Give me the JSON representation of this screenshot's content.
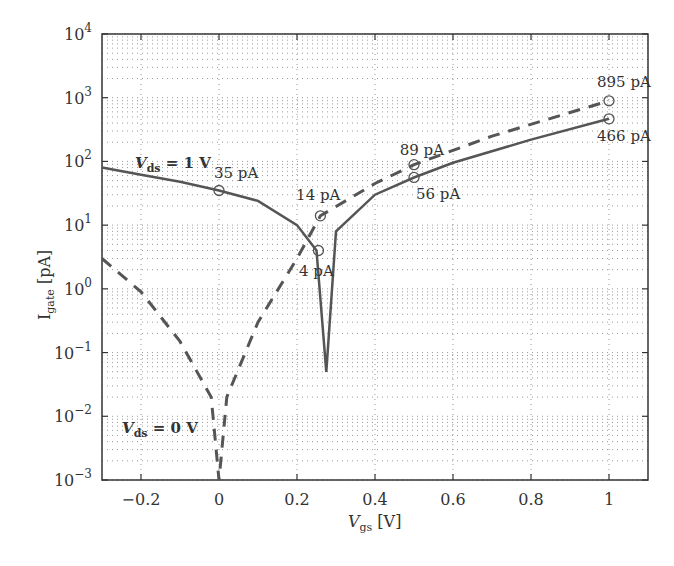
{
  "chart_data": {
    "type": "line",
    "title": "",
    "xlabel": "V_gs [V]",
    "ylabel": "I_gate [pA]",
    "xlim": [
      -0.3,
      1.1
    ],
    "ylim": [
      0.001,
      10000
    ],
    "yscale": "log",
    "grid": true,
    "x_ticks": [
      "-0.2",
      "0",
      "0.2",
      "0.4",
      "0.6",
      "0.8",
      "1"
    ],
    "y_ticks": [
      "10^-3",
      "10^-2",
      "10^-1",
      "10^0",
      "10^1",
      "10^2",
      "10^3",
      "10^4"
    ],
    "series": [
      {
        "name": "V_ds = 1 V",
        "style": "solid",
        "x": [
          -0.3,
          -0.2,
          -0.1,
          0.0,
          0.1,
          0.2,
          0.25,
          0.275,
          0.3,
          0.4,
          0.5,
          0.6,
          0.8,
          1.0
        ],
        "values": [
          80,
          62,
          48,
          35,
          24,
          10,
          4,
          0.05,
          8,
          30,
          56,
          95,
          220,
          466
        ]
      },
      {
        "name": "V_ds = 0 V",
        "style": "dashed",
        "x": [
          -0.3,
          -0.2,
          -0.1,
          -0.02,
          0.0,
          0.02,
          0.1,
          0.2,
          0.26,
          0.4,
          0.5,
          0.7,
          1.0
        ],
        "values": [
          3,
          0.9,
          0.15,
          0.02,
          0.001,
          0.02,
          0.3,
          3,
          14,
          45,
          89,
          250,
          895
        ]
      }
    ],
    "annotations": [
      {
        "text": "35 pA",
        "x": 0.0,
        "y": 35
      },
      {
        "text": "14 pA",
        "x": 0.26,
        "y": 14
      },
      {
        "text": "4 pA",
        "x": 0.255,
        "y": 4
      },
      {
        "text": "89 pA",
        "x": 0.5,
        "y": 89
      },
      {
        "text": "56 pA",
        "x": 0.5,
        "y": 56
      },
      {
        "text": "895 pA",
        "x": 1.0,
        "y": 895
      },
      {
        "text": "466 pA",
        "x": 1.0,
        "y": 466
      }
    ],
    "series_labels": [
      {
        "text_main": "V",
        "text_sub": "ds",
        "text_rest": " = 1 V"
      },
      {
        "text_main": "V",
        "text_sub": "ds",
        "text_rest": " = 0 V"
      }
    ]
  },
  "axes": {
    "xlabel_main": "V",
    "xlabel_sub": "gs",
    "xlabel_rest": " [V]",
    "ylabel_main": "I",
    "ylabel_sub": "gate",
    "ylabel_rest": " [pA]"
  },
  "colors": {
    "curve": "#555555",
    "grid": "#999999",
    "axis": "#333333"
  }
}
